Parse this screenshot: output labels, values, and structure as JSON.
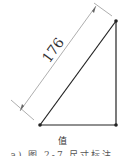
{
  "diagram": {
    "type": "right-triangle-dimension",
    "dimension_label": "176",
    "caption_line1": "值",
    "caption_line2": "a) 图 2-7  尺寸标注",
    "colors": {
      "stroke": "#222222",
      "dimension_line": "#999999",
      "vertex": "#222222"
    },
    "vertices": [
      {
        "name": "bottom-left",
        "x": 40,
        "y": 125
      },
      {
        "name": "bottom-right",
        "x": 116,
        "y": 125
      },
      {
        "name": "top-right",
        "x": 116,
        "y": 21
      }
    ]
  }
}
